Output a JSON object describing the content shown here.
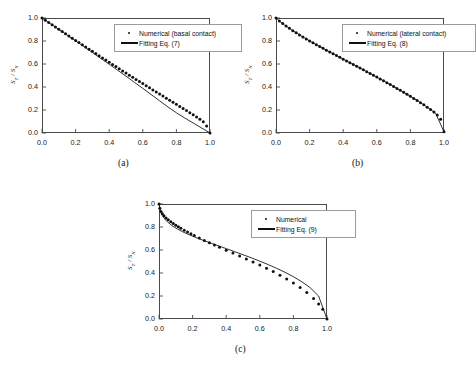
{
  "figure": {
    "panels": [
      {
        "caption": "(a)",
        "ylabel_main": "S",
        "ylabel_sub1": "T",
        "ylabel_div": " / S",
        "ylabel_sub2": "N",
        "legend": [
          {
            "key": "marker",
            "label": "Numerical (basal contact)"
          },
          {
            "key": "line",
            "label": "Fitting Eq. (7)"
          }
        ]
      },
      {
        "caption": "(b)",
        "ylabel_main": "S",
        "ylabel_sub1": "T",
        "ylabel_div": " / S",
        "ylabel_sub2": "N",
        "legend": [
          {
            "key": "marker",
            "label": "Numerical (lateral contact)"
          },
          {
            "key": "line",
            "label": "Fitting Eq. (8)"
          }
        ]
      },
      {
        "caption": "(c)",
        "ylabel_main": "S",
        "ylabel_sub1": "T",
        "ylabel_div": " / S",
        "ylabel_sub2": "N",
        "legend": [
          {
            "key": "marker",
            "label": "Numerical"
          },
          {
            "key": "line",
            "label": "Fitting Eq. (9)"
          }
        ]
      }
    ],
    "xticks": [
      "0.0",
      "0.2",
      "0.4",
      "0.6",
      "0.8",
      "1.0"
    ],
    "yticks": [
      "0.0",
      "0.2",
      "0.4",
      "0.6",
      "0.8",
      "1.0"
    ]
  },
  "chart_data": [
    {
      "type": "scatter",
      "title": "",
      "panel": "(a)",
      "xlabel": "",
      "ylabel": "S_T / S_N",
      "xlim": [
        0.0,
        1.0
      ],
      "ylim": [
        0.0,
        1.0
      ],
      "xticks": [
        0.0,
        0.2,
        0.4,
        0.6,
        0.8,
        1.0
      ],
      "yticks": [
        0.0,
        0.2,
        0.4,
        0.6,
        0.8,
        1.0
      ],
      "grid": false,
      "legend_position": "upper-right",
      "series": [
        {
          "name": "Numerical (basal contact)",
          "style": "markers",
          "x": [
            0.0,
            0.02,
            0.04,
            0.06,
            0.08,
            0.1,
            0.12,
            0.14,
            0.16,
            0.18,
            0.2,
            0.22,
            0.24,
            0.26,
            0.28,
            0.3,
            0.32,
            0.34,
            0.36,
            0.38,
            0.4,
            0.42,
            0.44,
            0.46,
            0.48,
            0.5,
            0.52,
            0.54,
            0.56,
            0.58,
            0.6,
            0.62,
            0.64,
            0.66,
            0.68,
            0.7,
            0.72,
            0.74,
            0.76,
            0.78,
            0.8,
            0.82,
            0.84,
            0.86,
            0.88,
            0.9,
            0.92,
            0.94,
            0.96,
            0.98,
            1.0
          ],
          "y": [
            1.0,
            0.98,
            0.96,
            0.941,
            0.921,
            0.902,
            0.882,
            0.863,
            0.844,
            0.824,
            0.805,
            0.786,
            0.767,
            0.748,
            0.729,
            0.71,
            0.691,
            0.672,
            0.653,
            0.634,
            0.615,
            0.596,
            0.578,
            0.559,
            0.54,
            0.522,
            0.503,
            0.485,
            0.466,
            0.448,
            0.43,
            0.411,
            0.393,
            0.375,
            0.357,
            0.339,
            0.321,
            0.303,
            0.285,
            0.267,
            0.249,
            0.231,
            0.213,
            0.195,
            0.177,
            0.158,
            0.139,
            0.119,
            0.097,
            0.06,
            0.0
          ]
        },
        {
          "name": "Fitting Eq. (7)",
          "style": "line",
          "x": [
            0.0,
            0.05,
            0.1,
            0.15,
            0.2,
            0.25,
            0.3,
            0.35,
            0.4,
            0.45,
            0.5,
            0.55,
            0.6,
            0.65,
            0.7,
            0.75,
            0.8,
            0.85,
            0.9,
            0.95,
            1.0
          ],
          "y": [
            1.0,
            0.951,
            0.901,
            0.851,
            0.801,
            0.751,
            0.7,
            0.649,
            0.598,
            0.546,
            0.494,
            0.441,
            0.388,
            0.334,
            0.28,
            0.226,
            0.176,
            0.13,
            0.087,
            0.044,
            0.0
          ]
        }
      ]
    },
    {
      "type": "scatter",
      "title": "",
      "panel": "(b)",
      "xlabel": "",
      "ylabel": "S_T / S_N",
      "xlim": [
        0.0,
        1.0
      ],
      "ylim": [
        0.0,
        1.0
      ],
      "xticks": [
        0.0,
        0.2,
        0.4,
        0.6,
        0.8,
        1.0
      ],
      "yticks": [
        0.0,
        0.2,
        0.4,
        0.6,
        0.8,
        1.0
      ],
      "grid": false,
      "legend_position": "upper-right",
      "series": [
        {
          "name": "Numerical (lateral contact)",
          "style": "markers",
          "x": [
            0.0,
            0.02,
            0.04,
            0.06,
            0.08,
            0.1,
            0.12,
            0.14,
            0.16,
            0.18,
            0.2,
            0.22,
            0.24,
            0.26,
            0.28,
            0.3,
            0.32,
            0.34,
            0.36,
            0.38,
            0.4,
            0.42,
            0.44,
            0.46,
            0.48,
            0.5,
            0.52,
            0.54,
            0.56,
            0.58,
            0.6,
            0.62,
            0.64,
            0.66,
            0.68,
            0.7,
            0.72,
            0.74,
            0.76,
            0.78,
            0.8,
            0.82,
            0.84,
            0.86,
            0.88,
            0.9,
            0.92,
            0.94,
            0.96,
            0.98,
            1.0
          ],
          "y": [
            1.0,
            0.975,
            0.952,
            0.93,
            0.91,
            0.89,
            0.871,
            0.853,
            0.835,
            0.818,
            0.801,
            0.784,
            0.768,
            0.752,
            0.736,
            0.72,
            0.704,
            0.689,
            0.673,
            0.658,
            0.642,
            0.627,
            0.611,
            0.596,
            0.58,
            0.565,
            0.549,
            0.533,
            0.518,
            0.502,
            0.486,
            0.47,
            0.454,
            0.438,
            0.421,
            0.405,
            0.388,
            0.371,
            0.354,
            0.337,
            0.319,
            0.301,
            0.283,
            0.264,
            0.245,
            0.225,
            0.204,
            0.182,
            0.157,
            0.12,
            0.01
          ]
        },
        {
          "name": "Fitting Eq. (8)",
          "style": "line",
          "x": [
            0.0,
            0.05,
            0.1,
            0.15,
            0.2,
            0.25,
            0.3,
            0.35,
            0.4,
            0.45,
            0.5,
            0.55,
            0.6,
            0.65,
            0.7,
            0.75,
            0.8,
            0.85,
            0.9,
            0.95,
            1.0
          ],
          "y": [
            1.0,
            0.94,
            0.89,
            0.845,
            0.801,
            0.76,
            0.72,
            0.681,
            0.642,
            0.604,
            0.565,
            0.526,
            0.486,
            0.446,
            0.405,
            0.363,
            0.319,
            0.274,
            0.225,
            0.172,
            0.01
          ]
        }
      ]
    },
    {
      "type": "scatter",
      "title": "",
      "panel": "(c)",
      "xlabel": "",
      "ylabel": "S_T / S_N",
      "xlim": [
        0.0,
        1.0
      ],
      "ylim": [
        0.0,
        1.0
      ],
      "xticks": [
        0.0,
        0.2,
        0.4,
        0.6,
        0.8,
        1.0
      ],
      "yticks": [
        0.0,
        0.2,
        0.4,
        0.6,
        0.8,
        1.0
      ],
      "grid": false,
      "legend_position": "upper-right",
      "series": [
        {
          "name": "Numerical",
          "style": "markers",
          "x": [
            0.0,
            0.005,
            0.012,
            0.02,
            0.03,
            0.042,
            0.055,
            0.07,
            0.085,
            0.1,
            0.115,
            0.13,
            0.15,
            0.17,
            0.19,
            0.21,
            0.24,
            0.27,
            0.3,
            0.33,
            0.36,
            0.4,
            0.44,
            0.48,
            0.52,
            0.56,
            0.6,
            0.64,
            0.68,
            0.72,
            0.76,
            0.8,
            0.84,
            0.88,
            0.92,
            0.95,
            0.975,
            1.0
          ],
          "y": [
            1.0,
            0.962,
            0.935,
            0.915,
            0.897,
            0.879,
            0.862,
            0.845,
            0.83,
            0.816,
            0.802,
            0.789,
            0.772,
            0.756,
            0.741,
            0.726,
            0.704,
            0.683,
            0.663,
            0.643,
            0.624,
            0.598,
            0.573,
            0.548,
            0.522,
            0.496,
            0.469,
            0.441,
            0.412,
            0.381,
            0.348,
            0.313,
            0.274,
            0.23,
            0.178,
            0.13,
            0.085,
            0.0
          ]
        },
        {
          "name": "Fitting Eq. (9)",
          "style": "line",
          "x": [
            0.0,
            0.01,
            0.02,
            0.035,
            0.05,
            0.07,
            0.09,
            0.11,
            0.14,
            0.17,
            0.2,
            0.24,
            0.28,
            0.32,
            0.36,
            0.4,
            0.45,
            0.5,
            0.55,
            0.6,
            0.65,
            0.7,
            0.75,
            0.8,
            0.85,
            0.9,
            0.95,
            1.0
          ],
          "y": [
            1.0,
            0.93,
            0.898,
            0.868,
            0.845,
            0.82,
            0.8,
            0.782,
            0.759,
            0.739,
            0.72,
            0.697,
            0.675,
            0.654,
            0.633,
            0.612,
            0.586,
            0.559,
            0.532,
            0.503,
            0.473,
            0.441,
            0.406,
            0.368,
            0.324,
            0.272,
            0.2,
            0.0
          ]
        }
      ]
    }
  ]
}
